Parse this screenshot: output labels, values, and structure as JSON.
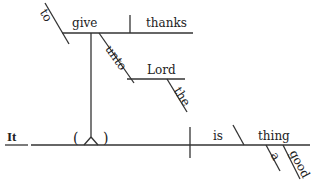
{
  "diagram": {
    "type": "Reed-Kellogg sentence diagram",
    "sentence_words": {
      "subject": "It",
      "verb": "is",
      "predicate_nominative": "thing",
      "modifiers_of_thing": [
        "a",
        "good"
      ],
      "infinitive_marker": "to",
      "infinitive_verb": "give",
      "direct_object": "thanks",
      "preposition": "unto",
      "prep_object": "Lord",
      "prep_object_modifier": "the",
      "placeholder": "( )"
    },
    "colors": {
      "ink": "#222222",
      "background": "#ffffff"
    }
  }
}
